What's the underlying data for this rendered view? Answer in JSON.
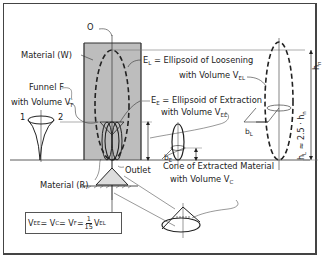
{
  "diagram": {
    "type": "technical-illustration",
    "labels": {
      "point_o": "O",
      "material_w": "Material (W)",
      "funnel_line1": "Funnel F",
      "funnel_line2_prefix": "with Volume V",
      "funnel_line2_sub": "F",
      "funnel_pt1": "1",
      "funnel_pt2": "2",
      "el_symbol": "E",
      "el_sub": "L",
      "el_text": " = Ellipsoid of Loosening",
      "el_vol_prefix": "with Volume V",
      "el_vol_sub": "EL",
      "ee_symbol": "E",
      "ee_sub": "E",
      "ee_text": " = Ellipsoid of Extraction",
      "ee_vol_prefix": "with Volume V",
      "ee_vol_sub": "EE",
      "outlet": "Outlet",
      "material_r": "Material (R)",
      "cone_line1": "Cone of Extracted Material",
      "cone_line2_prefix": "with Volume V",
      "cone_line2_sub": "C",
      "be_symbol": "b",
      "be_sub": "E",
      "bl_symbol": "b",
      "bl_sub": "L",
      "hn_label": "h",
      "hn_sub": "n",
      "hl_relation": "h",
      "hl_relation_sub": "L",
      "hl_relation_text": " ≈ 2.5 · h",
      "hl_relation_tail_sub": "n"
    },
    "formula": {
      "v_ee": "V",
      "v_ee_sub": "EE",
      "eq1": " = V",
      "v_c_sub": "C",
      "eq2": " = V",
      "v_f_sub": "F",
      "eq3": " = ",
      "frac_num": "1",
      "frac_den": "15",
      "v_el": " V",
      "v_el_sub": "EL"
    },
    "colors": {
      "material_fill": "#bdbdbd",
      "line": "#222222",
      "frame": "#444444",
      "background": "#ffffff"
    }
  }
}
